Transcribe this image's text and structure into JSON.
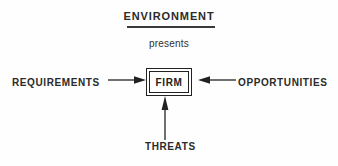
{
  "diagram": {
    "title": "ENVIRONMENT",
    "subtitle": "presents",
    "center": {
      "label": "FIRM"
    },
    "inputs": {
      "left": "REQUIREMENTS",
      "right": "OPPORTUNITIES",
      "bottom": "THREATS"
    },
    "colors": {
      "background": "#fefefe",
      "stroke": "#222222",
      "text": "#2b2b2b",
      "subtitle_text": "#303030"
    }
  }
}
